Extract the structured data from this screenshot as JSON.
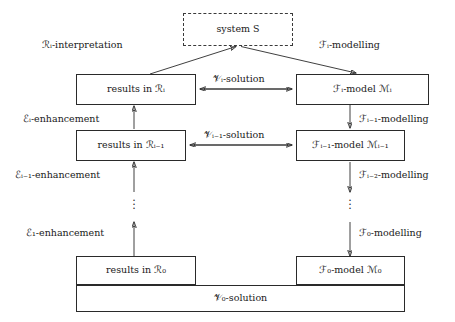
{
  "diagram": {
    "type": "flow-diagram",
    "system_box": {
      "label": "system S",
      "style": "dashed"
    },
    "rows": [
      {
        "level": "i",
        "results_box": "results in ℛᵢ",
        "model_box": "ℱᵢ-model ℳᵢ",
        "solution_label": "𝒱ᵢ-solution",
        "interpretation_label": "ℛᵢ-interpretation",
        "modelling_label": "ℱᵢ-modelling"
      },
      {
        "level": "i-1",
        "results_box": "results in ℛᵢ₋₁",
        "model_box": "ℱᵢ₋₁-model ℳᵢ₋₁",
        "solution_label": "𝒱ᵢ₋₁-solution",
        "enhancement_label": "ℰᵢ-enhancement",
        "modelling_label": "ℱᵢ₋₁-modelling"
      },
      {
        "level": "gap",
        "enhancement_label": "ℰᵢ₋₁-enhancement",
        "modelling_label": "ℱᵢ₋₂-modelling"
      },
      {
        "level": "0",
        "results_box": "results in ℛ₀",
        "model_box": "ℱ₀-model ℳ₀",
        "enhancement_label": "ℰ₁-enhancement",
        "modelling_label": "ℱ₀-modelling"
      }
    ],
    "bottom_solution_box": "𝒱₀-solution",
    "vertical_ellipsis": "⋮",
    "colors": {
      "stroke": "#2a2a2a",
      "background": "#ffffff",
      "text": "#1a1a1a"
    }
  }
}
